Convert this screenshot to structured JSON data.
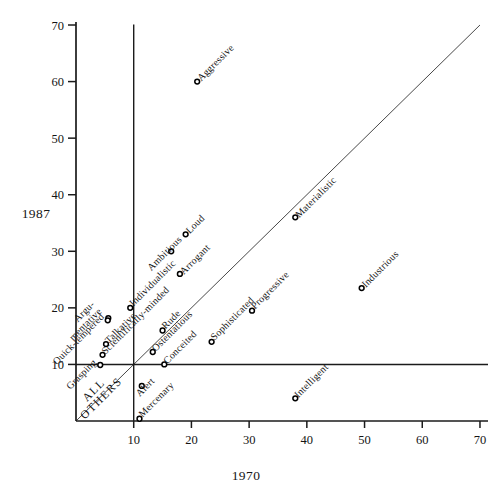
{
  "figure": {
    "xlabel": "1970",
    "ylabel": "1987",
    "background": "#ffffff",
    "ink_color": "#1b1b1b"
  },
  "chart_data": {
    "type": "scatter",
    "title": "",
    "xlabel": "1970",
    "ylabel": "1987",
    "xlim": [
      0,
      70
    ],
    "ylim": [
      0,
      70
    ],
    "x_ticks": [
      10,
      20,
      30,
      40,
      50,
      60,
      70
    ],
    "y_ticks": [
      10,
      20,
      30,
      40,
      50,
      60,
      70
    ],
    "grid": false,
    "legend_position": "none",
    "marker": "open-circle",
    "label_rotation_deg": -45,
    "reference_lines": {
      "vertical_at_x": 10,
      "horizontal_at_y": 10,
      "identity_diagonal": true
    },
    "region_annotation": {
      "lines": [
        "ALL",
        "OTHERS"
      ],
      "location": "near-origin-on-diagonal",
      "rotation_deg": -45
    },
    "points": [
      {
        "label": "Aggressive",
        "x1970": 21,
        "x1987": 60,
        "lp": [
          4,
          0
        ],
        "la": "start"
      },
      {
        "label": "Materialistic",
        "x1970": 38,
        "x1987": 36,
        "lp": [
          4,
          1
        ],
        "la": "start"
      },
      {
        "label": "Industrious",
        "x1970": 49.5,
        "x1987": 23.5,
        "lp": [
          4,
          0
        ],
        "la": "start"
      },
      {
        "label": "Loud",
        "x1970": 19,
        "x1987": 33,
        "lp": [
          4,
          0
        ],
        "la": "start"
      },
      {
        "label": "Ambitious",
        "x1970": 16.5,
        "x1987": 30,
        "lp": [
          -20,
          20
        ],
        "la": "start"
      },
      {
        "label": "Arrogant",
        "x1970": 18,
        "x1987": 26,
        "lp": [
          4,
          1
        ],
        "la": "start"
      },
      {
        "label": "Individualistic",
        "x1970": 9.4,
        "x1987": 20,
        "lp": [
          3,
          -1
        ],
        "la": "start"
      },
      {
        "label": "Argumentative",
        "display_lines": [
          "Argu-",
          "mentative"
        ],
        "x1970": 5.6,
        "x1987": 18.2,
        "lp": [
          -6,
          -6
        ],
        "la": "end"
      },
      {
        "label": "Quick-tempered",
        "x1970": 5.5,
        "x1987": 17.8,
        "lp": [
          -3,
          -3
        ],
        "la": "end"
      },
      {
        "label": "Talkative",
        "x1970": 5.2,
        "x1987": 13.6,
        "lp": [
          3,
          0
        ],
        "la": "start"
      },
      {
        "label": "Scientifically-minded",
        "x1970": 4.6,
        "x1987": 11.7,
        "lp": [
          3,
          0
        ],
        "la": "start"
      },
      {
        "label": "Grasping",
        "x1970": 4.2,
        "x1987": 9.9,
        "lp": [
          -3,
          -2
        ],
        "la": "end"
      },
      {
        "label": "Rude",
        "x1970": 15,
        "x1987": 16,
        "lp": [
          3,
          -1
        ],
        "la": "start"
      },
      {
        "label": "Ostentatious",
        "x1970": 13.3,
        "x1987": 12.2,
        "lp": [
          3,
          0
        ],
        "la": "start"
      },
      {
        "label": "Conceited",
        "x1970": 15.3,
        "x1987": 10,
        "lp": [
          3,
          0
        ],
        "la": "start"
      },
      {
        "label": "Sophisticated",
        "x1970": 23.5,
        "x1987": 14,
        "lp": [
          3,
          -1
        ],
        "la": "start"
      },
      {
        "label": "Progressive",
        "x1970": 30.5,
        "x1987": 19.5,
        "lp": [
          3,
          -1
        ],
        "la": "start"
      },
      {
        "label": "Intelligent",
        "x1970": 38,
        "x1987": 4,
        "lp": [
          3,
          0
        ],
        "la": "start"
      },
      {
        "label": "Alert",
        "x1970": 11.4,
        "x1987": 6.2,
        "lp": [
          -2,
          11
        ],
        "la": "start"
      },
      {
        "label": "Mercenary",
        "x1970": 11,
        "x1987": 0.4,
        "lp": [
          3,
          -1
        ],
        "la": "start"
      }
    ]
  }
}
